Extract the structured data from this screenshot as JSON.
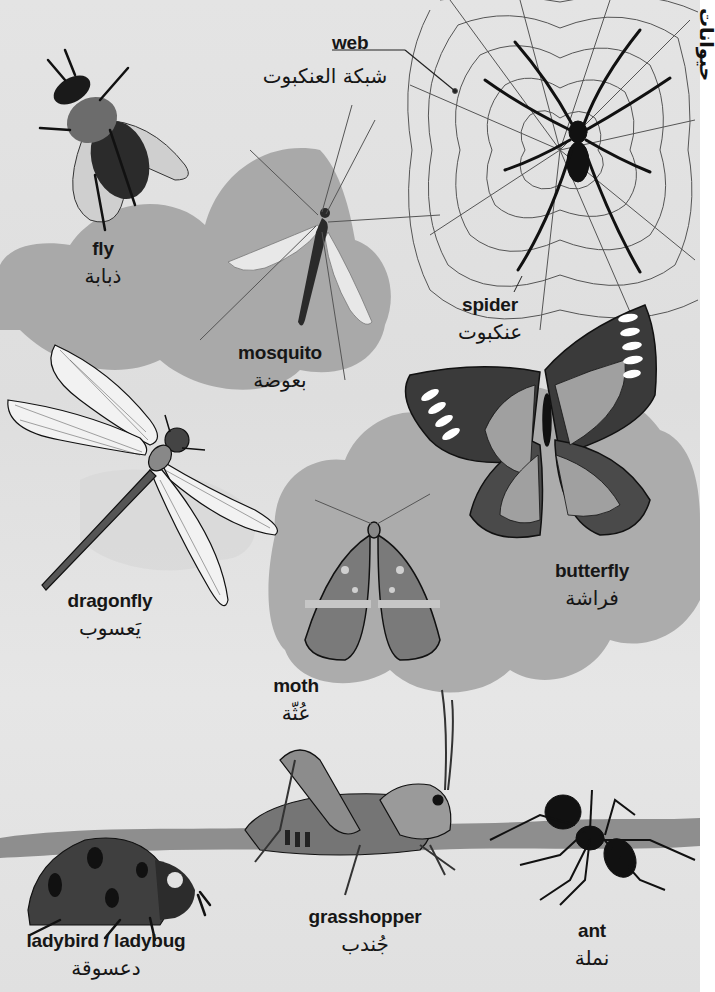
{
  "page": {
    "section_title_ar": "حيوانات",
    "colors": {
      "background": "#e2e2e2",
      "cloud": "#a8a8a8",
      "cloud_light": "#bdbdbd",
      "ink": "#161616"
    }
  },
  "entries": [
    {
      "id": "web",
      "en": "web",
      "ar": "شبكة العنكبوت",
      "icon": "spider-web-icon"
    },
    {
      "id": "fly",
      "en": "fly",
      "ar": "ذبابة",
      "icon": "fly-icon"
    },
    {
      "id": "mosquito",
      "en": "mosquito",
      "ar": "بعوضة",
      "icon": "mosquito-icon"
    },
    {
      "id": "spider",
      "en": "spider",
      "ar": "عنكبوت",
      "icon": "spider-icon"
    },
    {
      "id": "dragonfly",
      "en": "dragonfly",
      "ar": "يَعسوب",
      "icon": "dragonfly-icon"
    },
    {
      "id": "butterfly",
      "en": "butterfly",
      "ar": "فراشة",
      "icon": "butterfly-icon"
    },
    {
      "id": "moth",
      "en": "moth",
      "ar": "عُثّة",
      "icon": "moth-icon"
    },
    {
      "id": "grasshopper",
      "en": "grasshopper",
      "ar": "جُندب",
      "icon": "grasshopper-icon"
    },
    {
      "id": "ladybird",
      "en": "ladybird / ladybug",
      "ar": "دعسوقة",
      "icon": "ladybird-icon"
    },
    {
      "id": "ant",
      "en": "ant",
      "ar": "نملة",
      "icon": "ant-icon"
    }
  ]
}
